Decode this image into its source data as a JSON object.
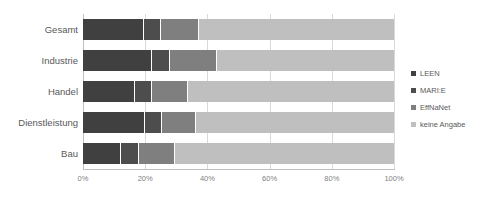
{
  "chart_data": {
    "type": "bar",
    "orientation": "horizontal",
    "stacked": true,
    "normalized_percent": true,
    "title": "",
    "subtitle": "",
    "xlabel": "",
    "ylabel": "",
    "xlim": [
      0,
      100
    ],
    "xticks": [
      "0%",
      "20%",
      "40%",
      "60%",
      "80%",
      "100%"
    ],
    "xtick_values": [
      0,
      20,
      40,
      60,
      80,
      100
    ],
    "grid": true,
    "grid_axis": "x",
    "legend_position": "right",
    "categories": [
      "Gesamt",
      "Industrie",
      "Handel",
      "Dienstleistung",
      "Bau"
    ],
    "series": [
      {
        "name": "LEEN",
        "color": "#404040",
        "values": [
          19.6,
          22.2,
          16.7,
          19.9,
          12.2
        ]
      },
      {
        "name": "MARI:E",
        "color": "#4d4d4d",
        "values": [
          5.5,
          5.8,
          5.5,
          5.5,
          5.8
        ]
      },
      {
        "name": "EffNaNet",
        "color": "#7f7f7f",
        "values": [
          12.2,
          15.1,
          11.6,
          10.9,
          11.6
        ]
      },
      {
        "name": "keine Angabe",
        "color": "#bfbfbf",
        "values": [
          62.7,
          56.9,
          66.2,
          63.7,
          70.4
        ]
      }
    ]
  },
  "legend": {
    "items": [
      {
        "label": "LEEN",
        "color": "#404040"
      },
      {
        "label": "MARI:E",
        "color": "#4d4d4d"
      },
      {
        "label": "EffNaNet",
        "color": "#7f7f7f"
      },
      {
        "label": "keine Angabe",
        "color": "#bfbfbf"
      }
    ]
  },
  "colors": {
    "gridline": "#d9d9d9",
    "axis": "#bfbfbf",
    "text": "#595959",
    "tick_text": "#7f7f7f",
    "background": "#ffffff"
  }
}
